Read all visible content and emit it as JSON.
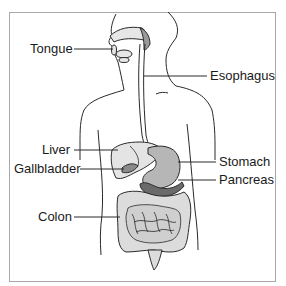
{
  "diagram": {
    "labels": {
      "tongue": "Tongue",
      "esophagus": "Esophagus",
      "liver": "Liver",
      "gallbladder": "Gallbladder",
      "stomach": "Stomach",
      "pancreas": "Pancreas",
      "colon": "Colon"
    },
    "colors": {
      "outline": "#2a2a2a",
      "organ_light": "#e2e2e2",
      "organ_mid": "#b9b9b9",
      "organ_dark": "#6e6e6e",
      "frame": "#a8a8a8"
    }
  }
}
